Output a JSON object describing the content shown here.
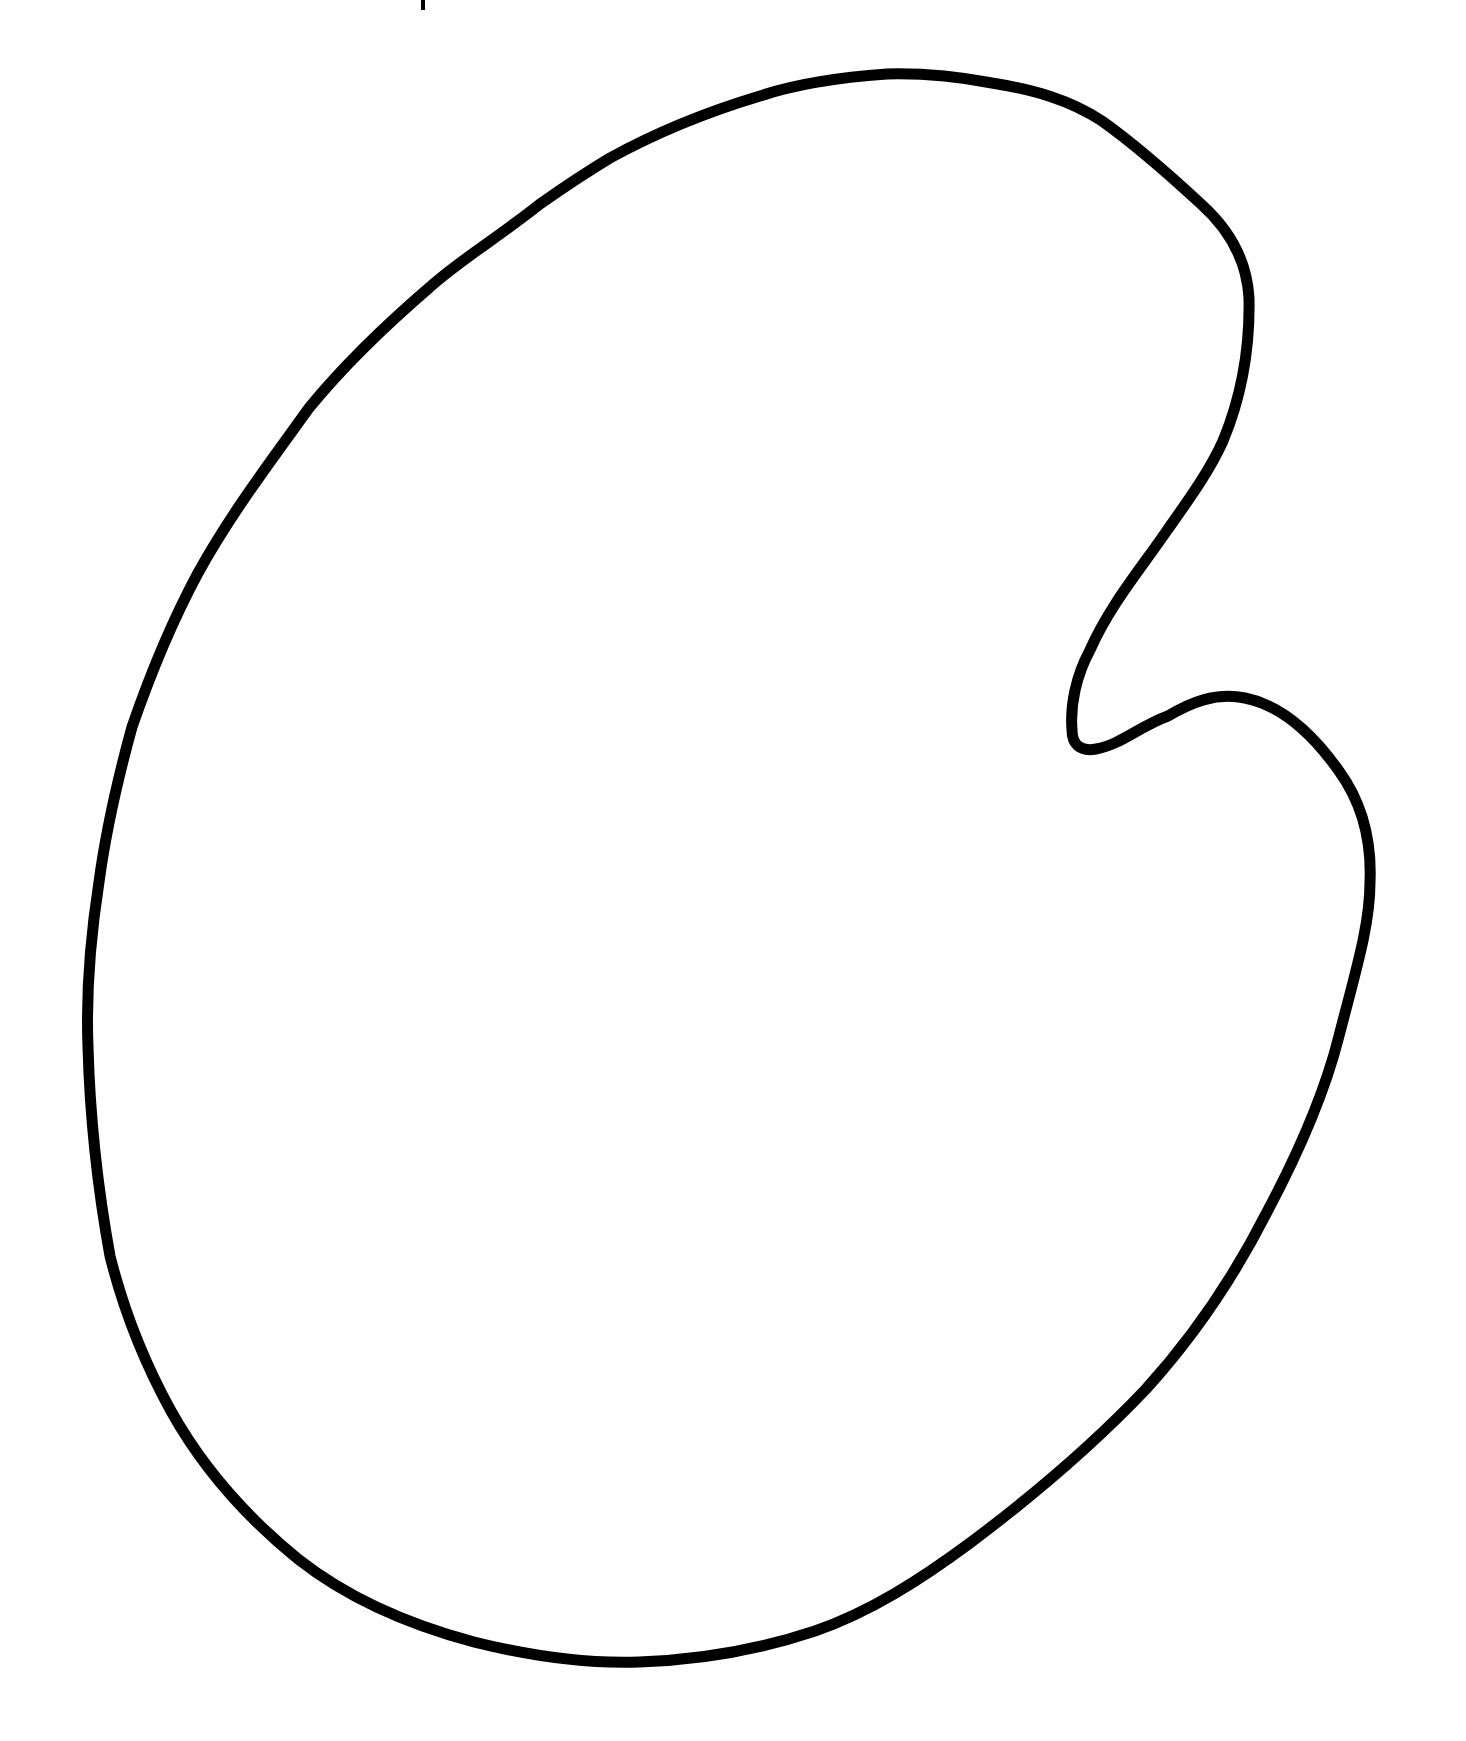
{
  "figure": {
    "background_color": "#ffffff",
    "stroke_color": "#000000",
    "stroke_width": 11,
    "fill_color": "none"
  },
  "tick_mark": {
    "x": 423,
    "y_top": 0,
    "y_bottom": 10,
    "color": "#000000"
  },
  "outline_path": "M 887 74 C 830 78 790 86 760 96 C 700 114 650 136 610 158 C 580 176 560 190 540 204 C 500 236 460 260 430 287 C 380 330 340 370 309 408 C 270 462 230 515 198 573 C 170 625 150 675 132 727 C 118 778 106 830 99 882 C 90 940 86 995 88 1047 C 90 1120 98 1190 110 1256 C 124 1312 144 1362 171 1411 C 205 1472 250 1520 298 1559 C 350 1600 410 1625 474 1642 C 530 1656 585 1664 639 1662 C 700 1660 758 1650 815 1631 C 870 1612 920 1580 970 1543 C 1030 1498 1090 1448 1146 1389 C 1195 1335 1235 1275 1267 1212 C 1300 1150 1325 1092 1339 1036 C 1356 970 1370 925 1370 882 C 1372 835 1360 800 1339 771 C 1310 730 1280 705 1245 698 C 1215 692 1190 703 1168 716 C 1140 726 1120 745 1096 749 C 1080 752 1072 744 1072 730 C 1070 705 1076 676 1090 650 C 1110 605 1140 570 1168 529 C 1190 498 1210 470 1223 441 C 1242 395 1250 345 1249 298 C 1247 262 1230 230 1201 204 C 1175 180 1140 148 1102 121 C 1070 100 1035 90 992 83 C 960 77 925 73 887 74 Z"
}
